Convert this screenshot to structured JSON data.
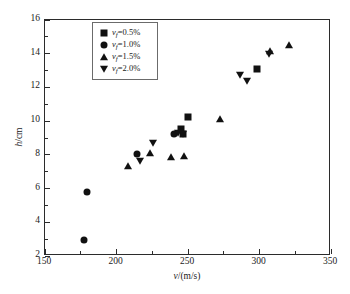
{
  "chart_data": {
    "type": "scatter",
    "title": "",
    "xlabel": "v/(m/s)",
    "ylabel": "h/cm",
    "xlim": [
      150,
      350
    ],
    "ylim": [
      2,
      16
    ],
    "xticks": [
      150,
      200,
      250,
      300,
      350
    ],
    "yticks": [
      2,
      4,
      6,
      8,
      10,
      12,
      14,
      16
    ],
    "xtick_labels": [
      "150",
      "200",
      "250",
      "300",
      "350"
    ],
    "ytick_labels": [
      "2",
      "4",
      "6",
      "8",
      "10",
      "12",
      "14",
      "16"
    ],
    "x_minor_ticks": [
      175,
      225,
      275,
      325
    ],
    "y_minor_ticks": [
      3,
      5,
      7,
      9,
      11,
      13,
      15
    ],
    "grid": false,
    "legend_position": "upper left",
    "series": [
      {
        "name": "vf=0.5%",
        "marker": "square",
        "points": [
          {
            "x": 246,
            "y": 9.5
          },
          {
            "x": 251,
            "y": 10.2
          },
          {
            "x": 247,
            "y": 9.2
          },
          {
            "x": 299,
            "y": 13.05
          }
        ]
      },
      {
        "name": "vf=1.0%",
        "marker": "circle",
        "points": [
          {
            "x": 178,
            "y": 2.9
          },
          {
            "x": 180,
            "y": 5.75
          },
          {
            "x": 215,
            "y": 8.0
          },
          {
            "x": 241,
            "y": 9.15
          }
        ]
      },
      {
        "name": "vf=1.5%",
        "marker": "triangle-up",
        "points": [
          {
            "x": 209,
            "y": 7.3
          },
          {
            "x": 224,
            "y": 8.05
          },
          {
            "x": 239,
            "y": 7.8
          },
          {
            "x": 248,
            "y": 7.9
          },
          {
            "x": 273,
            "y": 10.05
          },
          {
            "x": 308,
            "y": 14.1
          },
          {
            "x": 321,
            "y": 14.45
          }
        ]
      },
      {
        "name": "vf=2.0%",
        "marker": "triangle-down",
        "points": [
          {
            "x": 217,
            "y": 7.6
          },
          {
            "x": 226,
            "y": 8.65
          },
          {
            "x": 244,
            "y": 9.25
          },
          {
            "x": 247,
            "y": 9.2
          },
          {
            "x": 287,
            "y": 12.65
          },
          {
            "x": 292,
            "y": 12.3
          },
          {
            "x": 307,
            "y": 13.9
          }
        ]
      }
    ]
  },
  "legend": {
    "items": [
      {
        "symbol": "square",
        "label_prefix": "v",
        "label_sub": "f",
        "label_value": "=0.5%"
      },
      {
        "symbol": "circle",
        "label_prefix": "v",
        "label_sub": "f",
        "label_value": "=1.0%"
      },
      {
        "symbol": "triangle-up",
        "label_prefix": "v",
        "label_sub": "f",
        "label_value": "=1.5%"
      },
      {
        "symbol": "triangle-down",
        "label_prefix": "v",
        "label_sub": "f",
        "label_value": "=2.0%"
      }
    ]
  },
  "axes": {
    "x_title_italic": "v",
    "x_title_rest": "/(m/s)",
    "y_title_italic": "h",
    "y_title_rest": "/cm"
  },
  "colors": {
    "marker": "#111111",
    "frame": "#2b2b2b",
    "legend_border": "#6b6b6b",
    "background": "#ffffff"
  }
}
